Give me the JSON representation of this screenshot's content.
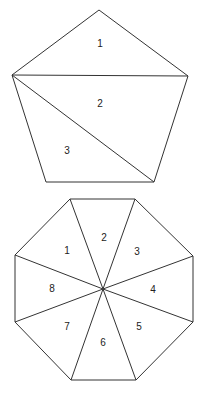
{
  "pentagon": {
    "vertices": [
      [
        99,
        10
      ],
      [
        188,
        76
      ],
      [
        154,
        182
      ],
      [
        46,
        182
      ],
      [
        12,
        75
      ]
    ],
    "diagonals": [
      [
        [
          12,
          75
        ],
        [
          188,
          76
        ]
      ],
      [
        [
          12,
          75
        ],
        [
          154,
          182
        ]
      ]
    ],
    "labels": [
      {
        "text": "1",
        "x": 100,
        "y": 44
      },
      {
        "text": "2",
        "x": 100,
        "y": 104
      },
      {
        "text": "3",
        "x": 67,
        "y": 151
      }
    ]
  },
  "octagon": {
    "vertices": [
      [
        70,
        199
      ],
      [
        135,
        199
      ],
      [
        193,
        256
      ],
      [
        193,
        322
      ],
      [
        136,
        380
      ],
      [
        71,
        380
      ],
      [
        15,
        322
      ],
      [
        15,
        255
      ]
    ],
    "center": [
      103,
      289
    ],
    "labels": [
      {
        "text": "1",
        "x": 67,
        "y": 251
      },
      {
        "text": "2",
        "x": 104,
        "y": 238
      },
      {
        "text": "3",
        "x": 137,
        "y": 252
      },
      {
        "text": "4",
        "x": 153,
        "y": 290
      },
      {
        "text": "5",
        "x": 139,
        "y": 327
      },
      {
        "text": "6",
        "x": 103,
        "y": 343
      },
      {
        "text": "7",
        "x": 67,
        "y": 327
      },
      {
        "text": "8",
        "x": 52,
        "y": 289
      }
    ]
  }
}
